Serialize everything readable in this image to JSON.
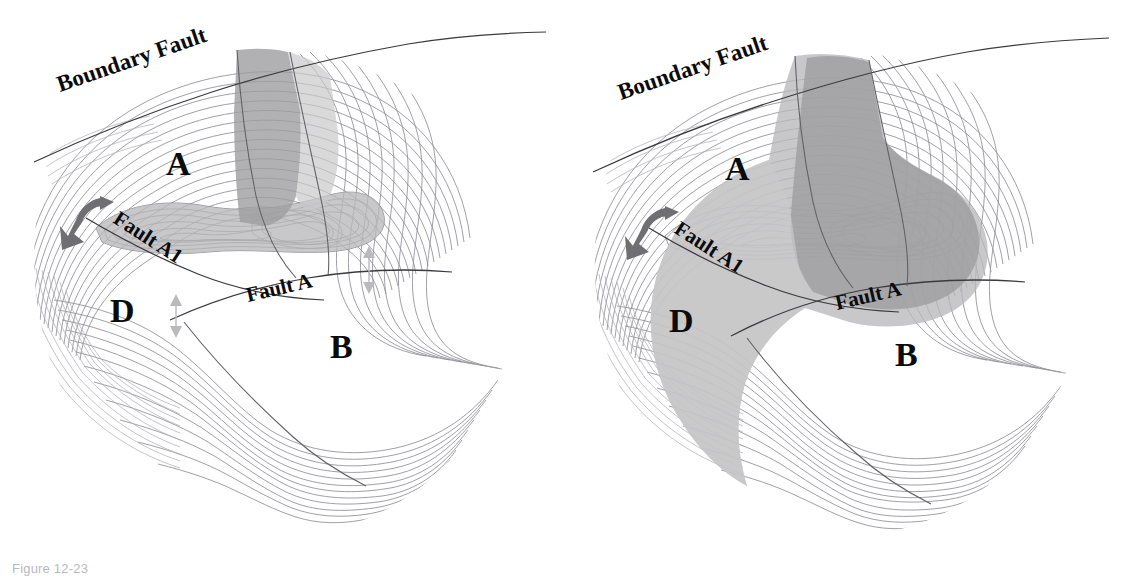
{
  "figure": {
    "caption": "Figure 12-23",
    "panels": [
      {
        "id": "left",
        "name": "pre-restoration-structure-map",
        "labels": {
          "boundary_fault": "Boundary Fault",
          "fault_a1": "Fault A1",
          "fault_a": "Fault A",
          "block_a": "A",
          "block_b": "B",
          "block_d": "D"
        },
        "annotations": {
          "slip_arrow": "curved-slip-arrow",
          "separation_arrow_upper": "double-headed-separation-arrow",
          "separation_arrow_lower": "double-headed-separation-arrow"
        },
        "shaded_area_note": "narrow crestal closure plus upper fault-bounded sliver"
      },
      {
        "id": "right",
        "name": "post-restoration-structure-map",
        "labels": {
          "boundary_fault": "Boundary Fault",
          "fault_a1": "Fault A1",
          "fault_a": "Fault A",
          "block_a": "A",
          "block_b": "B",
          "block_d": "D"
        },
        "annotations": {
          "slip_arrow": "curved-slip-arrow"
        },
        "shaded_area_note": "enlarged crestal closure merged with D block"
      }
    ],
    "colors": {
      "contour": "#8f8f96",
      "fault": "#3a3a3f",
      "shade_mid": "#b9b9bb",
      "shade_dark": "#9d9da0",
      "shade_light": "#c9c9cb",
      "slip_arrow": "#6e6e73",
      "separation_arrow": "#b9b9be",
      "caption": "#b9b9bd",
      "background": "#ffffff"
    }
  }
}
